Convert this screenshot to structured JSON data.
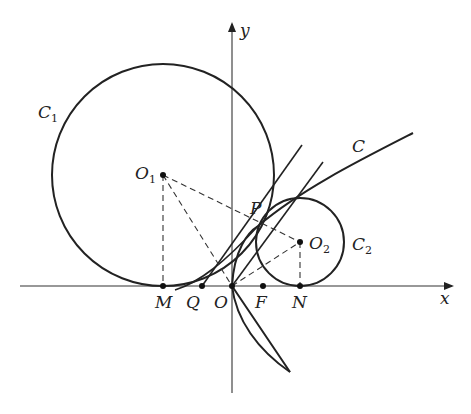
{
  "diagram": {
    "type": "geometry-figure",
    "axes": {
      "x_label": "x",
      "y_label": "y"
    },
    "curves": [
      {
        "id": "C",
        "label": "C",
        "kind": "parabola"
      },
      {
        "id": "C1",
        "label": "C",
        "sub": "1",
        "kind": "circle"
      },
      {
        "id": "C2",
        "label": "C",
        "sub": "2",
        "kind": "circle"
      }
    ],
    "points": {
      "O1": {
        "label": "O",
        "sub": "1"
      },
      "O2": {
        "label": "O",
        "sub": "2"
      },
      "P": {
        "label": "P"
      },
      "M": {
        "label": "M"
      },
      "Q": {
        "label": "Q"
      },
      "O": {
        "label": "O"
      },
      "F": {
        "label": "F"
      },
      "N": {
        "label": "N"
      }
    }
  }
}
